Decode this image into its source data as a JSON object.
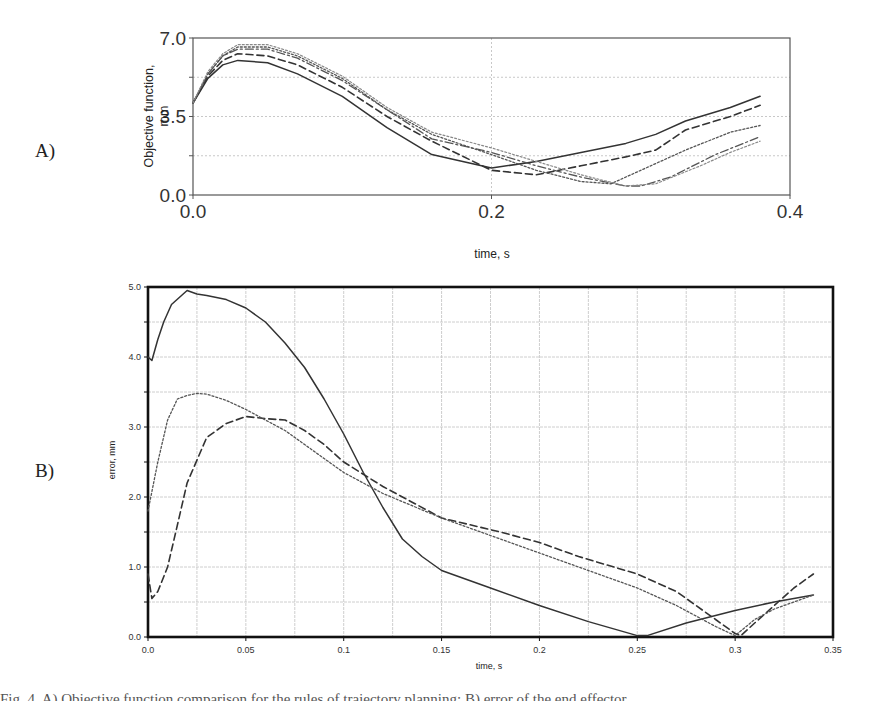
{
  "figure": {
    "panel_a_label": "A)",
    "panel_b_label": "B)",
    "caption": "Fig. 4. A) Objective function comparison for the rules of trajectory planning; B) error of the end effector"
  },
  "colors": {
    "axis": "#555555",
    "axis_b": "#111111",
    "grid": "#c8c8c8",
    "series_dark": "#333333",
    "series_mid": "#555555",
    "series_light": "#888888"
  },
  "chart_data": [
    {
      "id": "A",
      "type": "line",
      "title": "",
      "xlabel": "time, s",
      "ylabel": "Objective function, mm",
      "xlim": [
        0.0,
        0.4
      ],
      "ylim": [
        0.0,
        7.0
      ],
      "xticks": [
        0.0,
        0.2,
        0.4
      ],
      "xtick_labels": [
        "0.0",
        "0.2",
        "0.4"
      ],
      "yticks": [
        0.0,
        3.5,
        7.0
      ],
      "ytick_labels": [
        "0.0",
        "3.5",
        "7.0"
      ],
      "grid": true,
      "legend": "none",
      "series": [
        {
          "name": "solid",
          "style": "solid",
          "x": [
            0.0,
            0.01,
            0.02,
            0.03,
            0.05,
            0.07,
            0.1,
            0.13,
            0.16,
            0.2,
            0.23,
            0.26,
            0.29,
            0.31,
            0.33,
            0.36,
            0.38
          ],
          "y": [
            4.1,
            5.2,
            5.8,
            6.0,
            5.9,
            5.4,
            4.4,
            3.0,
            1.8,
            1.2,
            1.5,
            1.9,
            2.3,
            2.7,
            3.3,
            3.9,
            4.4
          ]
        },
        {
          "name": "dashed",
          "style": "dashed",
          "x": [
            0.0,
            0.01,
            0.02,
            0.03,
            0.05,
            0.07,
            0.1,
            0.13,
            0.16,
            0.2,
            0.23,
            0.26,
            0.29,
            0.31,
            0.33,
            0.36,
            0.38
          ],
          "y": [
            4.1,
            5.3,
            6.0,
            6.3,
            6.2,
            5.8,
            4.8,
            3.5,
            2.4,
            1.1,
            0.9,
            1.3,
            1.7,
            2.0,
            2.9,
            3.5,
            4.0
          ]
        },
        {
          "name": "dash-dot",
          "style": "dashdot",
          "x": [
            0.0,
            0.01,
            0.02,
            0.03,
            0.05,
            0.07,
            0.1,
            0.13,
            0.16,
            0.2,
            0.23,
            0.26,
            0.29,
            0.3,
            0.32,
            0.35,
            0.38
          ],
          "y": [
            4.1,
            5.4,
            6.2,
            6.5,
            6.5,
            6.1,
            5.1,
            3.8,
            2.5,
            1.9,
            1.3,
            0.8,
            0.4,
            0.4,
            0.8,
            1.8,
            2.6
          ]
        },
        {
          "name": "dotted-1",
          "style": "dotted",
          "x": [
            0.0,
            0.01,
            0.02,
            0.03,
            0.05,
            0.07,
            0.1,
            0.13,
            0.16,
            0.2,
            0.23,
            0.26,
            0.28,
            0.3,
            0.33,
            0.36,
            0.38
          ],
          "y": [
            4.1,
            5.4,
            6.2,
            6.6,
            6.6,
            6.2,
            5.2,
            3.8,
            2.7,
            1.8,
            1.1,
            0.6,
            0.5,
            1.1,
            2.0,
            2.8,
            3.1
          ]
        },
        {
          "name": "dotted-2",
          "style": "dotted-light",
          "x": [
            0.0,
            0.01,
            0.02,
            0.03,
            0.05,
            0.07,
            0.1,
            0.13,
            0.16,
            0.2,
            0.23,
            0.26,
            0.29,
            0.31,
            0.34,
            0.36,
            0.38
          ],
          "y": [
            4.1,
            5.5,
            6.3,
            6.7,
            6.7,
            6.3,
            5.3,
            3.9,
            2.8,
            2.1,
            1.5,
            0.9,
            0.4,
            0.5,
            1.3,
            1.9,
            2.4
          ]
        }
      ]
    },
    {
      "id": "B",
      "type": "line",
      "title": "",
      "xlabel": "time, s",
      "ylabel": "error, mm",
      "xlim": [
        0.0,
        0.35
      ],
      "ylim": [
        0.0,
        5.0
      ],
      "xticks": [
        0.0,
        0.05,
        0.1,
        0.15,
        0.2,
        0.25,
        0.3,
        0.35
      ],
      "xtick_labels": [
        "0.0",
        "0.05",
        "0.1",
        "0.15",
        "0.2",
        "0.25",
        "0.3",
        "0.35"
      ],
      "yticks": [
        0.0,
        1.0,
        2.0,
        3.0,
        4.0,
        5.0
      ],
      "ytick_labels": [
        "0.0",
        "1.0",
        "2.0",
        "3.0",
        "4.0",
        "5.0"
      ],
      "minor_xgrid_step": 0.025,
      "minor_ygrid_step": 0.5,
      "grid": true,
      "legend": "none",
      "series": [
        {
          "name": "solid",
          "style": "solid",
          "x": [
            0.0,
            0.002,
            0.005,
            0.008,
            0.012,
            0.016,
            0.02,
            0.025,
            0.03,
            0.04,
            0.05,
            0.06,
            0.07,
            0.08,
            0.09,
            0.1,
            0.11,
            0.12,
            0.13,
            0.14,
            0.15,
            0.175,
            0.2,
            0.225,
            0.25,
            0.255,
            0.275,
            0.3,
            0.32,
            0.34
          ],
          "y": [
            4.0,
            3.95,
            4.25,
            4.5,
            4.75,
            4.85,
            4.95,
            4.9,
            4.88,
            4.82,
            4.7,
            4.5,
            4.2,
            3.85,
            3.4,
            2.9,
            2.35,
            1.85,
            1.4,
            1.15,
            0.95,
            0.7,
            0.45,
            0.22,
            0.02,
            0.02,
            0.2,
            0.38,
            0.5,
            0.6
          ]
        },
        {
          "name": "dashed",
          "style": "dashed",
          "x": [
            0.0,
            0.002,
            0.005,
            0.01,
            0.015,
            0.02,
            0.03,
            0.04,
            0.05,
            0.06,
            0.07,
            0.08,
            0.09,
            0.1,
            0.12,
            0.15,
            0.18,
            0.2,
            0.22,
            0.25,
            0.27,
            0.29,
            0.3,
            0.303,
            0.31,
            0.32,
            0.33,
            0.34
          ],
          "y": [
            0.9,
            0.55,
            0.65,
            1.0,
            1.6,
            2.2,
            2.85,
            3.05,
            3.15,
            3.12,
            3.1,
            2.95,
            2.75,
            2.5,
            2.15,
            1.7,
            1.5,
            1.35,
            1.15,
            0.9,
            0.65,
            0.25,
            0.05,
            0.02,
            0.2,
            0.45,
            0.7,
            0.9
          ]
        },
        {
          "name": "dotted",
          "style": "dotted",
          "x": [
            0.0,
            0.005,
            0.01,
            0.015,
            0.02,
            0.025,
            0.03,
            0.04,
            0.05,
            0.06,
            0.07,
            0.08,
            0.09,
            0.1,
            0.12,
            0.15,
            0.18,
            0.2,
            0.22,
            0.25,
            0.27,
            0.29,
            0.3,
            0.31,
            0.32,
            0.33,
            0.34
          ],
          "y": [
            1.8,
            2.5,
            3.1,
            3.4,
            3.45,
            3.48,
            3.47,
            3.38,
            3.25,
            3.1,
            2.95,
            2.75,
            2.55,
            2.35,
            2.05,
            1.7,
            1.4,
            1.2,
            1.0,
            0.7,
            0.45,
            0.15,
            0.02,
            0.25,
            0.4,
            0.5,
            0.6
          ]
        }
      ]
    }
  ]
}
